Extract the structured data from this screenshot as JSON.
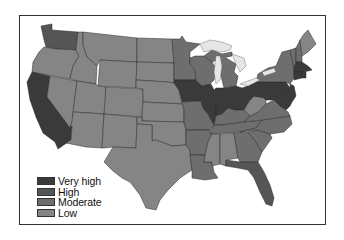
{
  "map": {
    "title": "",
    "region": "Contiguous United States"
  },
  "legend": {
    "items": [
      {
        "key": "very_high",
        "label": "Very high",
        "color": "#3a3a3a"
      },
      {
        "key": "high",
        "label": "High",
        "color": "#555555"
      },
      {
        "key": "moderate",
        "label": "Moderate",
        "color": "#6e6e6e"
      },
      {
        "key": "low",
        "label": "Low",
        "color": "#858585"
      }
    ]
  },
  "colors": {
    "very_high": "#3a3a3a",
    "high": "#555555",
    "moderate": "#6e6e6e",
    "low": "#858585",
    "lakes": "#e6e6e6",
    "background": "#ffffff",
    "frame": "#333333"
  },
  "states": {
    "WA": "high",
    "OR": "low",
    "CA": "very_high",
    "NV": "low",
    "ID": "low",
    "MT": "low",
    "WY": "low",
    "UT": "low",
    "AZ": "low",
    "CO": "low",
    "NM": "low",
    "ND": "low",
    "SD": "low",
    "NE": "low",
    "KS": "low",
    "OK": "low",
    "TX": "low",
    "MN": "moderate",
    "IA": "very_high",
    "MO": "moderate",
    "AR": "moderate",
    "LA": "moderate",
    "WI": "moderate",
    "IL": "very_high",
    "MI": "moderate",
    "IN": "very_high",
    "OH": "very_high",
    "KY": "moderate",
    "TN": "moderate",
    "MS": "low",
    "AL": "low",
    "GA": "moderate",
    "FL": "high",
    "SC": "moderate",
    "NC": "moderate",
    "VA": "moderate",
    "WV": "low",
    "PA": "very_high",
    "NY": "moderate",
    "VT": "moderate",
    "NH": "moderate",
    "ME": "low",
    "MA": "very_high",
    "CT": "very_high",
    "RI": "very_high",
    "NJ": "very_high",
    "DE": "very_high",
    "MD": "very_high"
  }
}
